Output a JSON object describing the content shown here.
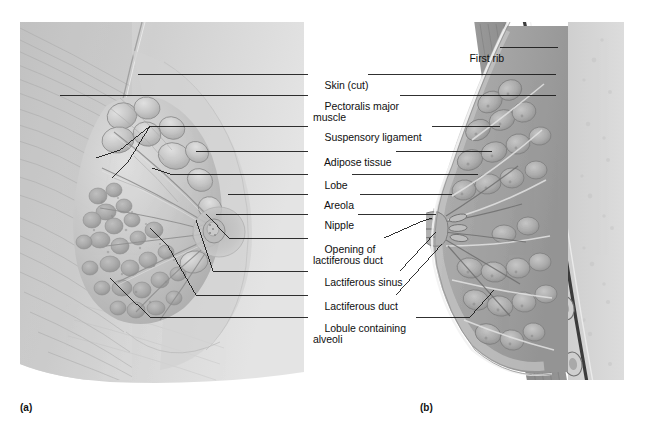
{
  "figure": {
    "type": "anatomical-illustration",
    "background_color": "#ffffff",
    "text_color": "#0f0f10",
    "leader_line_color": "#1a1a1a"
  },
  "panels": [
    {
      "id": "a",
      "caption": "(a)",
      "view": "anterior-view-partial-dissection",
      "caption_x": 20,
      "caption_y": 402
    },
    {
      "id": "b",
      "caption": "(b)",
      "view": "sagittal-section",
      "caption_x": 420,
      "caption_y": 402
    }
  ],
  "labels": [
    {
      "id": "skin-cut",
      "text": "Skin (cut)",
      "text2": "",
      "x": 313,
      "y": 69,
      "left_line": true,
      "right_line": true
    },
    {
      "id": "pectoralis-major",
      "text": "Pectoralis major",
      "text2": "muscle",
      "x": 313,
      "y": 90,
      "left_line": true,
      "right_line": true
    },
    {
      "id": "suspensory-ligament",
      "text": "Suspensory ligament",
      "text2": "",
      "x": 313,
      "y": 121,
      "left_line": true,
      "right_line": true
    },
    {
      "id": "adipose-tissue",
      "text": "Adipose tissue",
      "text2": "",
      "x": 313,
      "y": 146,
      "left_line": true,
      "right_line": true
    },
    {
      "id": "lobe",
      "text": "Lobe",
      "text2": "",
      "x": 313,
      "y": 169,
      "left_line": true,
      "right_line": true
    },
    {
      "id": "areola",
      "text": "Areola",
      "text2": "",
      "x": 313,
      "y": 189,
      "left_line": true,
      "right_line": true
    },
    {
      "id": "nipple",
      "text": "Nipple",
      "text2": "",
      "x": 313,
      "y": 209,
      "left_line": true,
      "right_line": true
    },
    {
      "id": "opening-lactiferous-duct",
      "text": "Opening of",
      "text2": "lactiferous duct",
      "x": 313,
      "y": 233,
      "left_line": true,
      "right_line": true
    },
    {
      "id": "lactiferous-sinus",
      "text": "Lactiferous sinus",
      "text2": "",
      "x": 313,
      "y": 266,
      "left_line": true,
      "right_line": true
    },
    {
      "id": "lactiferous-duct",
      "text": "Lactiferous duct",
      "text2": "",
      "x": 313,
      "y": 290,
      "left_line": true,
      "right_line": true
    },
    {
      "id": "lobule-alveoli",
      "text": "Lobule containing",
      "text2": "alveoli",
      "x": 313,
      "y": 312,
      "left_line": true,
      "right_line": true
    },
    {
      "id": "first-rib",
      "text": "First rib",
      "text2": "",
      "x": 458,
      "y": 42,
      "left_line": false,
      "right_line": true
    }
  ]
}
